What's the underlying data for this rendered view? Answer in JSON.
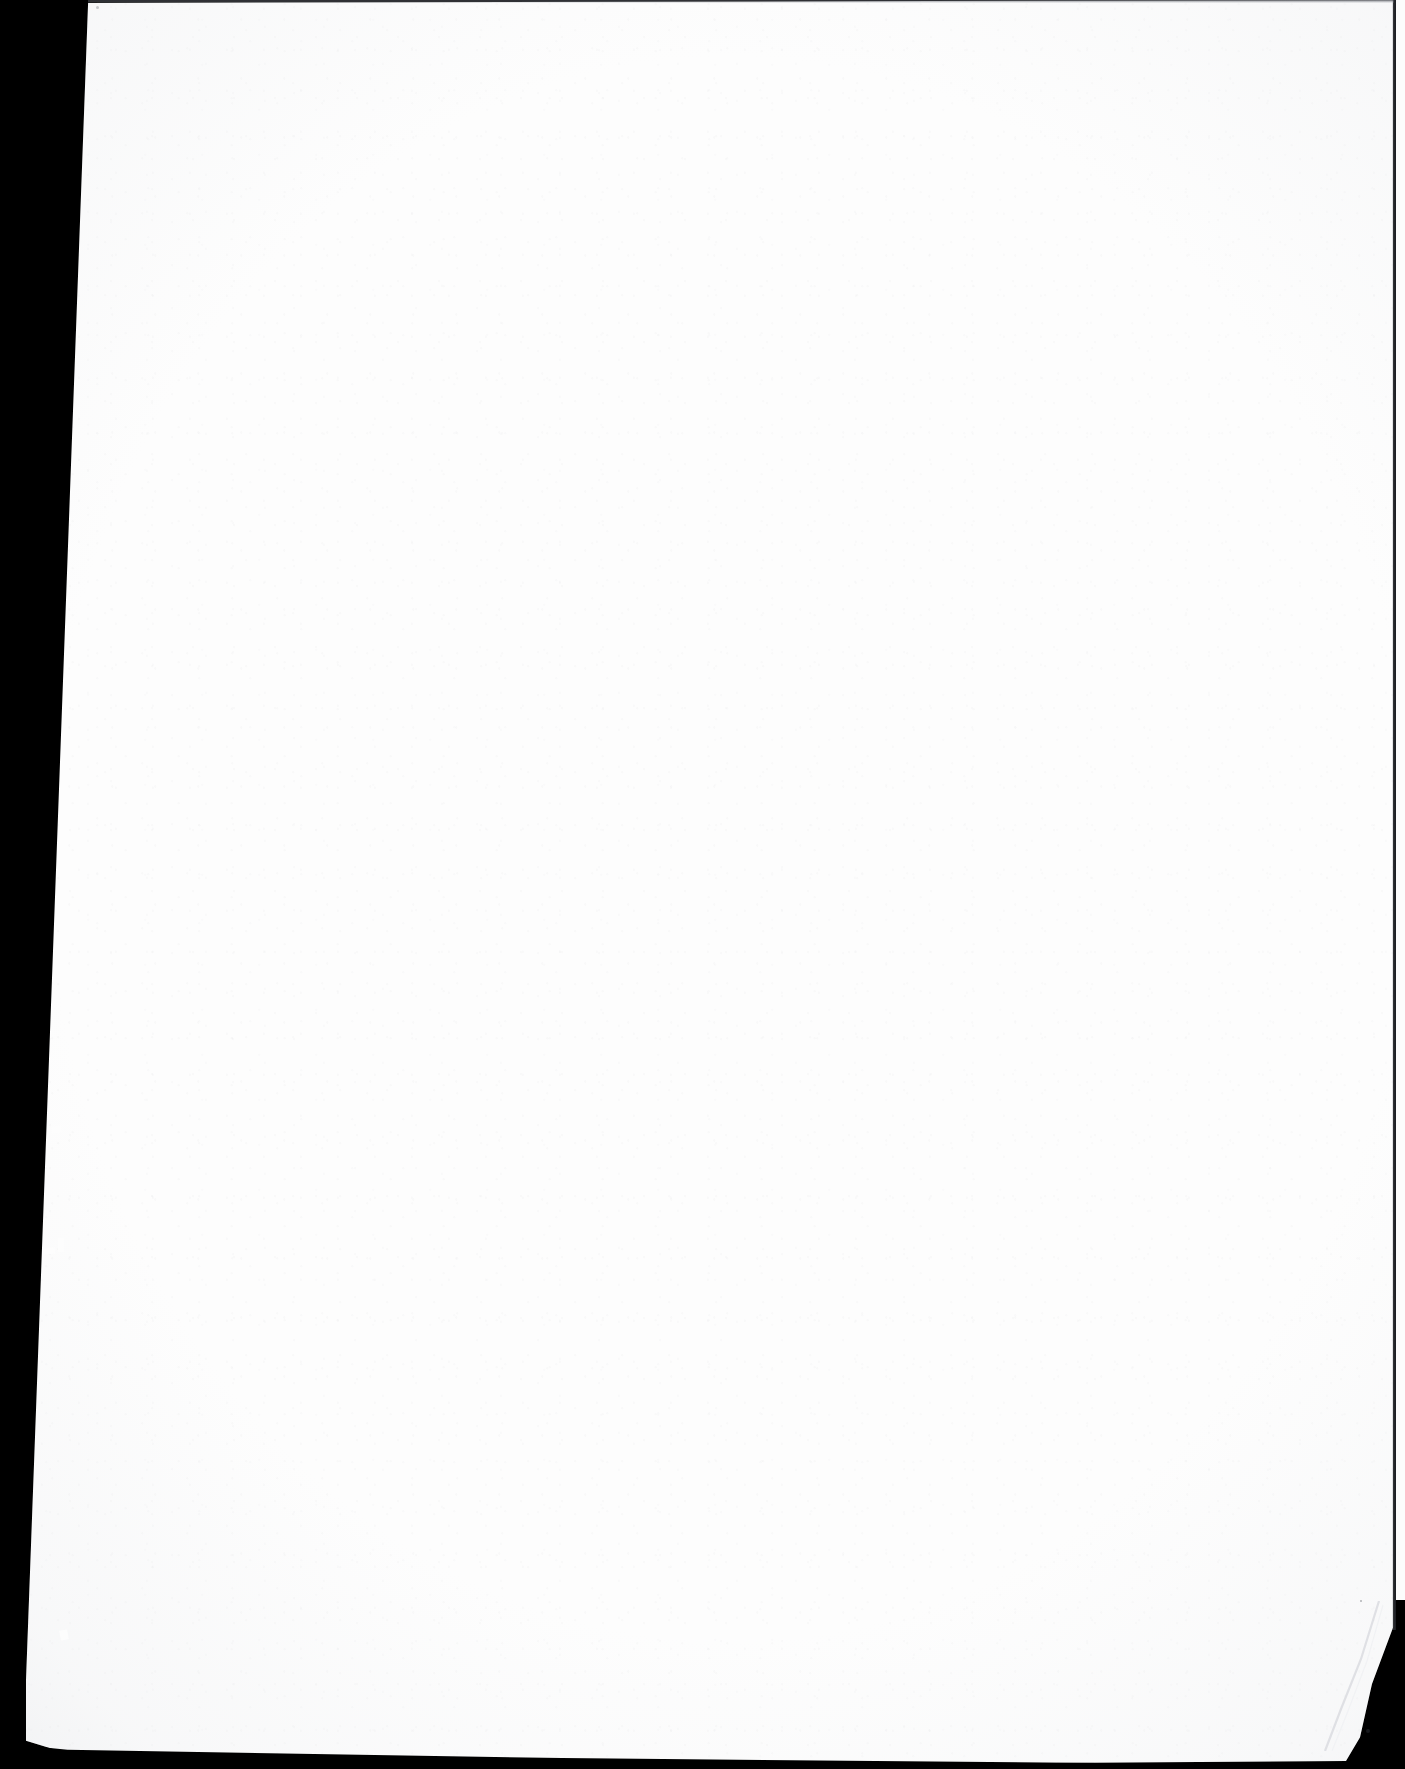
{
  "page": {
    "kind": "scanned-document-page",
    "content_text": "",
    "is_blank": true,
    "width_px": 1405,
    "height_px": 1769
  },
  "colors": {
    "scanner_background": "#000000",
    "paper": "#fdfdfd",
    "edge_shadow": "#3c3e44",
    "crease_line": "#d8dade"
  },
  "regions": {
    "scanner_bed_label": "scanner-background",
    "paper_label": "blank-page",
    "left_black_margin_label": "left-scanner-margin",
    "bottom_black_margin_label": "bottom-scanner-margin",
    "top_edge_label": "page-top-edge",
    "right_edge_label": "page-right-edge",
    "bent_corner_label": "bent-bottom-right-corner"
  }
}
